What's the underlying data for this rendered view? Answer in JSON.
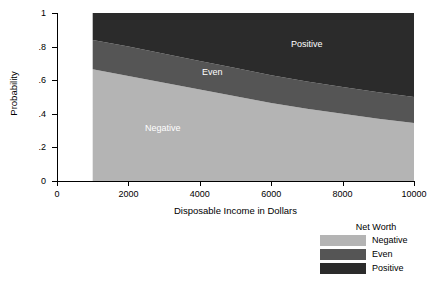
{
  "chart_data": {
    "type": "area",
    "title": "",
    "xlabel": "Disposable Income in Dollars",
    "ylabel": "Probability",
    "xlim": [
      0,
      10000
    ],
    "ylim": [
      0,
      1
    ],
    "grid": false,
    "stacked": true,
    "x_ticks": [
      "0",
      "2000",
      "4000",
      "6000",
      "8000",
      "10000"
    ],
    "x_tick_values": [
      0,
      2000,
      4000,
      6000,
      8000,
      10000
    ],
    "y_ticks": [
      "0",
      ".2",
      ".4",
      ".6",
      ".8",
      "1"
    ],
    "y_tick_values": [
      0,
      0.2,
      0.4,
      0.6,
      0.8,
      1
    ],
    "x": [
      1000,
      2000,
      3000,
      4000,
      5000,
      6000,
      7000,
      8000,
      9000,
      10000
    ],
    "series": [
      {
        "name": "Negative",
        "color": "#b4b4b4",
        "values": [
          0.665,
          0.625,
          0.585,
          0.545,
          0.505,
          0.465,
          0.43,
          0.4,
          0.37,
          0.345
        ],
        "cumulative_top": [
          0.665,
          0.625,
          0.585,
          0.545,
          0.505,
          0.465,
          0.43,
          0.4,
          0.37,
          0.345
        ]
      },
      {
        "name": "Even",
        "color": "#555555",
        "values": [
          0.175,
          0.175,
          0.172,
          0.17,
          0.168,
          0.165,
          0.163,
          0.16,
          0.158,
          0.155
        ],
        "cumulative_top": [
          0.84,
          0.8,
          0.757,
          0.715,
          0.673,
          0.63,
          0.593,
          0.56,
          0.528,
          0.5
        ]
      },
      {
        "name": "Positive",
        "color": "#2b2b2b",
        "values": [
          0.16,
          0.2,
          0.243,
          0.285,
          0.327,
          0.37,
          0.407,
          0.44,
          0.472,
          0.5
        ],
        "cumulative_top": [
          1,
          1,
          1,
          1,
          1,
          1,
          1,
          1,
          1,
          1
        ]
      }
    ],
    "annotations": [
      {
        "text": "Negative",
        "color": "#ffffff"
      },
      {
        "text": "Even",
        "color": "#ffffff"
      },
      {
        "text": "Positive",
        "color": "#ffffff"
      }
    ],
    "legend": {
      "title": "Net Worth",
      "position": "bottom-right",
      "entries": [
        {
          "label": "Negative",
          "color": "#b4b4b4"
        },
        {
          "label": "Even",
          "color": "#555555"
        },
        {
          "label": "Positive",
          "color": "#2b2b2b"
        }
      ]
    }
  }
}
